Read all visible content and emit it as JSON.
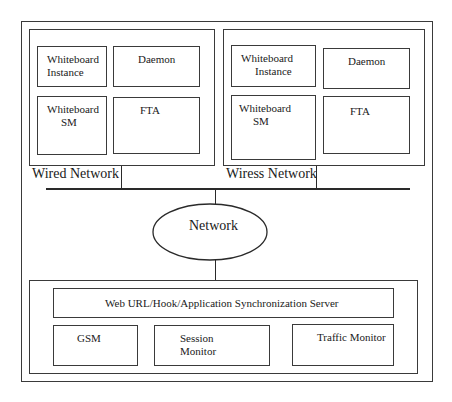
{
  "diagram": {
    "wired_group": {
      "label": "Wired Network",
      "components": {
        "whiteboard_instance": [
          "Whiteboard",
          "Instance"
        ],
        "daemon": "Daemon",
        "whiteboard_sm": [
          "Whiteboard",
          "SM"
        ],
        "fta": "FTA"
      }
    },
    "wireless_group": {
      "label": "Wiress Network",
      "components": {
        "whiteboard_instance": [
          "Whiteboard",
          "Instance"
        ],
        "daemon": "Daemon",
        "whiteboard_sm": [
          "Whiteboard",
          "SM"
        ],
        "fta": "FTA"
      }
    },
    "network": {
      "label": "Network"
    },
    "server_group": {
      "sync_server": "Web URL/Hook/Application Synchronization Server",
      "gsm": "GSM",
      "session_monitor": [
        "Session",
        "Monitor"
      ],
      "traffic_monitor": "Traffic Monitor"
    }
  }
}
